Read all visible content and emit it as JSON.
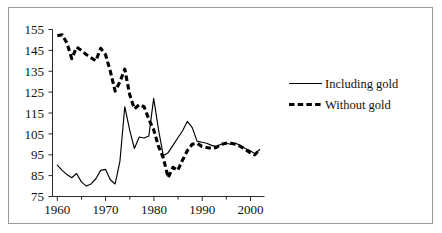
{
  "chart_data": {
    "type": "line",
    "title": "",
    "xlabel": "",
    "ylabel": "",
    "xlim": [
      1959,
      2003
    ],
    "ylim": [
      75,
      155
    ],
    "grid": false,
    "legend_position": "right",
    "y_ticks": [
      75,
      85,
      95,
      105,
      115,
      125,
      135,
      145,
      155
    ],
    "x_ticks": [
      1960,
      1970,
      1980,
      1990,
      2000
    ],
    "x_minor_ticks": [
      1965,
      1975,
      1985,
      1995
    ],
    "x": [
      1960,
      1961,
      1962,
      1963,
      1964,
      1965,
      1966,
      1967,
      1968,
      1969,
      1970,
      1971,
      1972,
      1973,
      1974,
      1975,
      1976,
      1977,
      1978,
      1979,
      1980,
      1981,
      1982,
      1983,
      1984,
      1985,
      1986,
      1987,
      1988,
      1989,
      1990,
      1991,
      1992,
      1993,
      1994,
      1995,
      1996,
      1997,
      1998,
      1999,
      2000,
      2001,
      2002
    ],
    "series": [
      {
        "name": "Including gold",
        "style": "solid",
        "color": "#000000",
        "values": [
          90.0,
          87.5,
          85.5,
          84.0,
          86.0,
          82.0,
          80.0,
          81.0,
          83.5,
          87.5,
          88.0,
          83.0,
          81.0,
          92.0,
          118.0,
          107.0,
          98.0,
          103.5,
          103.0,
          104.0,
          122.0,
          107.0,
          94.5,
          96.0,
          99.5,
          103.0,
          106.5,
          111.0,
          108.0,
          101.5,
          101.0,
          100.5,
          99.5,
          99.0,
          100.0,
          100.5,
          100.0,
          100.5,
          99.5,
          98.0,
          97.0,
          95.5,
          97.5
        ]
      },
      {
        "name": "Without gold",
        "style": "dashed",
        "color": "#000000",
        "values": [
          152.0,
          152.5,
          148.5,
          141.0,
          146.5,
          145.0,
          143.0,
          141.5,
          140.0,
          146.0,
          143.0,
          135.0,
          125.5,
          130.0,
          136.0,
          124.0,
          117.0,
          119.0,
          118.0,
          112.0,
          107.0,
          99.0,
          93.5,
          84.0,
          89.0,
          87.5,
          92.5,
          97.0,
          100.0,
          100.5,
          99.0,
          98.5,
          98.0,
          98.5,
          100.0,
          100.5,
          100.5,
          100.0,
          99.0,
          97.5,
          96.0,
          95.0,
          97.5
        ]
      }
    ]
  },
  "axes": {
    "y_tick_labels": [
      "155",
      "145",
      "135",
      "125",
      "115",
      "105",
      "95",
      "85",
      "75"
    ],
    "x_tick_labels": [
      "1960",
      "1970",
      "1980",
      "1990",
      "2000"
    ]
  },
  "legend": {
    "entries": [
      {
        "label": "Including gold",
        "style": "solid"
      },
      {
        "label": "Without gold",
        "style": "dashed"
      }
    ]
  }
}
